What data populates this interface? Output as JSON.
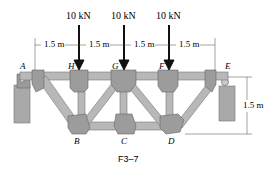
{
  "figure": {
    "caption": "F3–7",
    "loads": [
      {
        "label": "10 kN",
        "joint": "H"
      },
      {
        "label": "10 kN",
        "joint": "G"
      },
      {
        "label": "10 kN",
        "joint": "F"
      }
    ],
    "dimensions": {
      "spacings": [
        "1.5 m",
        "1.5 m",
        "1.5 m",
        "1.5 m"
      ],
      "height": "1.5 m"
    },
    "joints": {
      "top": [
        "A",
        "H",
        "G",
        "F",
        "E"
      ],
      "bottom": [
        "B",
        "C",
        "D"
      ]
    },
    "colors": {
      "member": "#b8b8b8",
      "gusset": "#9c9c9c",
      "support": "#a9a9a9",
      "text": "#222222"
    }
  }
}
